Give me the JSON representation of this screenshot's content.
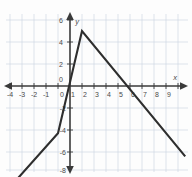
{
  "figure": {
    "background_color": "#fdfdfd",
    "grid_color": "#c9d4e0",
    "axis_color": "#3a3a3a",
    "curve_color": "#2e2e2e"
  },
  "chart_data": {
    "type": "line",
    "title": "",
    "subtitle": "",
    "xlabel": "x",
    "ylabel": "y",
    "xlim": [
      -5,
      10
    ],
    "ylim": [
      -9.5,
      7.5
    ],
    "xticks": [
      -4,
      -3,
      -2,
      -1,
      0,
      1,
      2,
      3,
      4,
      5,
      6,
      7,
      8,
      9
    ],
    "xtick_labels": [
      "-4",
      "-3",
      "-2",
      "-1",
      "0",
      "1",
      "2",
      "3",
      "4",
      "5",
      "6",
      "7",
      "8",
      "9"
    ],
    "yticks": [
      -8,
      -6,
      -4,
      -2,
      0,
      2,
      4,
      6
    ],
    "ytick_labels": [
      "-8",
      "-6",
      "-4",
      "-2",
      "0",
      "2",
      "4",
      "6"
    ],
    "grid": true,
    "grid_step_x": 1,
    "grid_step_y": 2,
    "legend": null,
    "legend_position": "none",
    "axis_arrows": [
      "left",
      "right",
      "up",
      "down"
    ],
    "series": [
      {
        "name": "piecewise-linear-function",
        "kind": "piecewise-linear",
        "points": [
          [
            -4.6,
            -8.7
          ],
          [
            -1.0,
            -4.3
          ],
          [
            1.0,
            5.0
          ],
          [
            9.6,
            -6.4
          ]
        ],
        "vertices": [
          {
            "x": -1.0,
            "y": -4.3,
            "label": "corner"
          },
          {
            "x": 1.0,
            "y": 5.0,
            "label": "peak"
          }
        ],
        "x_intercepts": [
          0.07,
          5.3
        ],
        "y_intercept": -0.3
      }
    ],
    "annotations": []
  },
  "axis_labels": {
    "x": "x",
    "y": "y"
  }
}
